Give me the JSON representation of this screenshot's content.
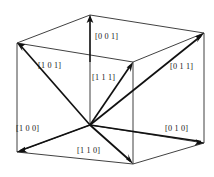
{
  "figure": {
    "name": "cubic-crystal-direction-indices",
    "background_color": "#ffffff",
    "line_color": "#2b2b2b",
    "vector_color": "#111111",
    "text_color": "#1a1a1a",
    "labels": {
      "up": "[0 0 1]",
      "upper_left": "[1 0 1]",
      "center": "[1 1 1]",
      "upper_right": "[0 1 1]",
      "lower_left": "[1 0 0]",
      "lower_center": "[1 1 0]",
      "lower_right": "[0 1 0]"
    },
    "label_positions": {
      "up": {
        "x": 95,
        "y": 39
      },
      "upper_left": {
        "x": 38,
        "y": 68
      },
      "center": {
        "x": 92,
        "y": 80
      },
      "upper_right": {
        "x": 170,
        "y": 69
      },
      "lower_left": {
        "x": 16,
        "y": 131
      },
      "lower_center": {
        "x": 77,
        "y": 153
      },
      "lower_right": {
        "x": 165,
        "y": 131
      }
    },
    "geometry": {
      "origin": {
        "x": 90,
        "y": 125
      },
      "vertices": {
        "back_top_left": {
          "x": 17,
          "y": 43
        },
        "back_top_right": {
          "x": 204,
          "y": 33
        },
        "top_back_mid": {
          "x": 90,
          "y": 15
        },
        "top_front_mid": {
          "x": 133,
          "y": 62
        },
        "bottom_left": {
          "x": 17,
          "y": 152
        },
        "bottom_right": {
          "x": 204,
          "y": 143
        },
        "bottom_front_mid": {
          "x": 133,
          "y": 164
        }
      }
    },
    "vectors": [
      {
        "label": "[0 0 1]",
        "from": "origin-upper",
        "to_x": 90,
        "to_y": 16
      },
      {
        "label": "[1 0 1]",
        "from": "origin",
        "to_x": 17,
        "to_y": 43
      },
      {
        "label": "[1 1 1]",
        "from": "origin",
        "to_x": 133,
        "to_y": 62
      },
      {
        "label": "[0 1 1]",
        "from": "origin",
        "to_x": 204,
        "to_y": 33
      },
      {
        "label": "[1 0 0]",
        "from": "origin",
        "to_x": 17,
        "to_y": 152
      },
      {
        "label": "[1 1 0]",
        "from": "origin",
        "to_x": 133,
        "to_y": 164
      },
      {
        "label": "[0 1 0]",
        "from": "origin",
        "to_x": 204,
        "to_y": 143
      }
    ]
  }
}
